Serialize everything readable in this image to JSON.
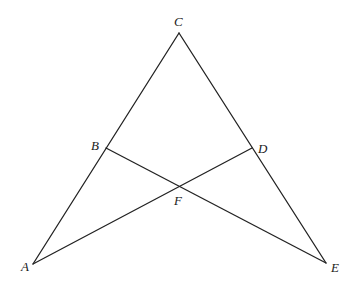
{
  "diagram": {
    "type": "geometry",
    "points": {
      "A": {
        "label": "A",
        "x": 33,
        "y": 264,
        "label_x": 21,
        "label_y": 271
      },
      "B": {
        "label": "B",
        "x": 106,
        "y": 148,
        "label_x": 91,
        "label_y": 150
      },
      "C": {
        "label": "C",
        "x": 179,
        "y": 33,
        "label_x": 174,
        "label_y": 26
      },
      "D": {
        "label": "D",
        "x": 252,
        "y": 148,
        "label_x": 258,
        "label_y": 153
      },
      "E": {
        "label": "E",
        "x": 326,
        "y": 263,
        "label_x": 331,
        "label_y": 272
      },
      "F": {
        "label": "F",
        "x": 179,
        "y": 186,
        "label_x": 174,
        "label_y": 205
      }
    },
    "segments": [
      {
        "name": "AC",
        "from": "A",
        "to": "C"
      },
      {
        "name": "CE",
        "from": "C",
        "to": "E"
      },
      {
        "name": "AD",
        "from": "A",
        "to": "D"
      },
      {
        "name": "BE",
        "from": "B",
        "to": "E"
      }
    ],
    "stroke_color": "#222222"
  }
}
